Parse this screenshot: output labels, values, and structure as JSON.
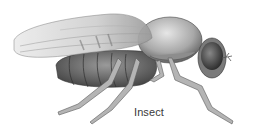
{
  "figure": {
    "label": "Insect",
    "colors": {
      "background": "#ffffff",
      "body_dark": "#4a4a4a",
      "body_mid": "#8a8a8a",
      "wing": "#d8d8d8",
      "label_text": "#3a3a3a"
    }
  }
}
